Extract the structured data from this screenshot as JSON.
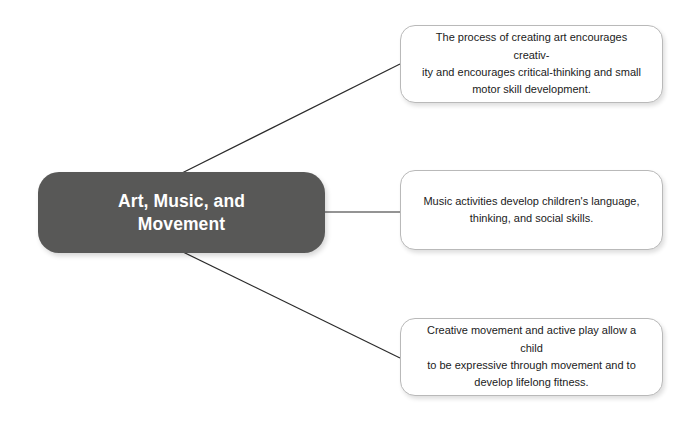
{
  "diagram": {
    "type": "hub-and-spoke concept map",
    "background_color": "#ffffff",
    "central_node": {
      "label": "Art, Music, and\nMovement",
      "fill_color": "#585857",
      "text_color": "#ffffff"
    },
    "connector_color": "#2b2b2b",
    "branches": [
      {
        "id": "branch-art",
        "text": "The process of creating art encourages creativ-\nity and encourages critical-thinking and small\nmotor skill development.",
        "fill_color": "#ffffff",
        "border_color": "#b9b9b9",
        "text_color": "#1b1b1b"
      },
      {
        "id": "branch-music",
        "text": "Music activities develop children's language,\nthinking, and social skills.",
        "fill_color": "#ffffff",
        "border_color": "#b9b9b9",
        "text_color": "#1b1b1b"
      },
      {
        "id": "branch-movement",
        "text": "Creative movement and active play allow a child\nto be expressive through movement and to\ndevelop lifelong fitness.",
        "fill_color": "#ffffff",
        "border_color": "#b9b9b9",
        "text_color": "#1b1b1b"
      }
    ]
  }
}
